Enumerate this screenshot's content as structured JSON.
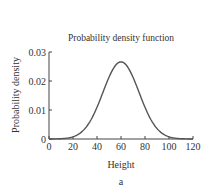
{
  "chart_data": {
    "type": "line",
    "title": "Probability density function",
    "xlabel": "Height",
    "ylabel": "Probability density",
    "caption": "a",
    "xlim": [
      0,
      120
    ],
    "ylim": [
      0,
      0.03
    ],
    "xticks": [
      0,
      20,
      40,
      60,
      80,
      100,
      120
    ],
    "yticks": [
      0,
      0.01,
      0.02,
      0.03
    ],
    "xtick_labels": [
      "0",
      "20",
      "40",
      "60",
      "80",
      "100",
      "120"
    ],
    "ytick_labels": [
      "0",
      "0.01",
      "0.02",
      "0.03"
    ],
    "grid": false,
    "legend": null,
    "series": [
      {
        "name": "Normal PDF (mean 60, sd 15)",
        "distribution": {
          "mean": 60,
          "sd": 15
        },
        "x": [
          0,
          10,
          20,
          30,
          40,
          50,
          60,
          70,
          80,
          90,
          100,
          110,
          120
        ],
        "values": [
          8.9e-06,
          0.0001022,
          0.0007611,
          0.0035994,
          0.010934,
          0.0212965,
          0.0265962,
          0.0212965,
          0.010934,
          0.0035994,
          0.0007611,
          0.0001022,
          8.9e-06
        ],
        "color": "#555555"
      }
    ]
  }
}
